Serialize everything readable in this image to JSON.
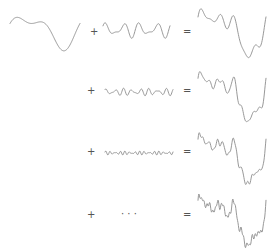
{
  "colors": {
    "stroke": "#8c8c8c",
    "operator": "#555555",
    "background": "#ffffff"
  },
  "rows": [
    {
      "plus": "+",
      "equals": "=",
      "ellipsis": null,
      "left": {
        "kind": "base-signal",
        "components": [
          [
            1,
            1.0,
            0.0
          ],
          [
            2,
            0.5,
            1.2
          ]
        ]
      },
      "middle": {
        "kind": "added-component",
        "components": [
          [
            4,
            0.6,
            0.3
          ],
          [
            6,
            0.35,
            1.0
          ]
        ],
        "amplitude": 0.55
      },
      "result": {
        "kind": "partial-sum",
        "terms": 2
      }
    },
    {
      "plus": "+",
      "equals": "=",
      "ellipsis": null,
      "left": null,
      "middle": {
        "kind": "added-component",
        "components": [
          [
            8,
            0.5,
            0.4
          ],
          [
            11,
            0.3,
            1.5
          ]
        ],
        "amplitude": 0.3
      },
      "result": {
        "kind": "partial-sum",
        "terms": 3
      }
    },
    {
      "plus": "+",
      "equals": "=",
      "ellipsis": null,
      "left": null,
      "middle": {
        "kind": "added-component",
        "components": [
          [
            14,
            0.4,
            0.8
          ],
          [
            18,
            0.3,
            0.2
          ]
        ],
        "amplitude": 0.18
      },
      "result": {
        "kind": "partial-sum",
        "terms": 4
      }
    },
    {
      "plus": "+",
      "equals": "=",
      "ellipsis": "· · ·",
      "left": null,
      "middle": null,
      "result": {
        "kind": "partial-sum",
        "terms": 5
      }
    }
  ]
}
